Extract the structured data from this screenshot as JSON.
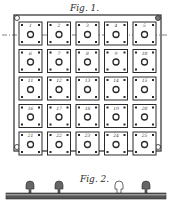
{
  "figure1": {
    "label": "Fig. 1.",
    "rows": 5,
    "cols": 5,
    "plates": [
      "1",
      "2",
      "3",
      "4",
      "5",
      "6",
      "7",
      "8",
      "9",
      "10",
      "11",
      "12",
      "13",
      "14",
      "15",
      "16",
      "17",
      "18",
      "19",
      "20",
      "21",
      "22",
      "23",
      "24",
      "25"
    ]
  },
  "figure2": {
    "label": "Fig. 2.",
    "description": "cross-section of plate row with bolt heads"
  },
  "colors": {
    "ink": "#2a2a2a",
    "paper": "#ffffff"
  }
}
